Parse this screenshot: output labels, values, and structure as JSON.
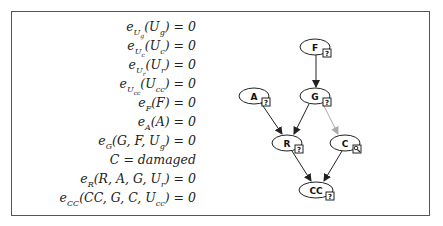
{
  "equations": [
    "e_{U_g}(U_g) = 0",
    "e_{U_c}(U_c) = 0",
    "e_{U_r}(U_r) = 0",
    "e_{U_cc}(U_cc) = 0",
    "e_F(F) = 0",
    "e_A(A) = 0",
    "e_G(G, F, U_g) = 0",
    "C = damaged",
    "e_R(R, A, G, U_r) = 0",
    "e_CC(CC, G, C, U_cc) = 0"
  ],
  "graph": {
    "nodes": [
      {
        "id": "F",
        "label": "F",
        "badge": "?",
        "badge_icon": "question-icon"
      },
      {
        "id": "A",
        "label": "A",
        "badge": "?",
        "badge_icon": "question-icon"
      },
      {
        "id": "G",
        "label": "G",
        "badge": "?",
        "badge_icon": "question-icon"
      },
      {
        "id": "R",
        "label": "R",
        "badge": "?",
        "badge_icon": "question-icon"
      },
      {
        "id": "C",
        "label": "C",
        "badge": "",
        "badge_icon": "magnifier-icon"
      },
      {
        "id": "CC",
        "label": "CC",
        "badge": "?",
        "badge_icon": "question-icon"
      }
    ],
    "edges": [
      {
        "from": "F",
        "to": "G",
        "style": "solid"
      },
      {
        "from": "A",
        "to": "R",
        "style": "solid"
      },
      {
        "from": "G",
        "to": "R",
        "style": "solid"
      },
      {
        "from": "G",
        "to": "C",
        "style": "gray"
      },
      {
        "from": "R",
        "to": "CC",
        "style": "solid"
      },
      {
        "from": "C",
        "to": "CC",
        "style": "solid"
      }
    ],
    "colors": {
      "edge": "#222222",
      "intervened_edge": "#aaaaaa"
    }
  }
}
